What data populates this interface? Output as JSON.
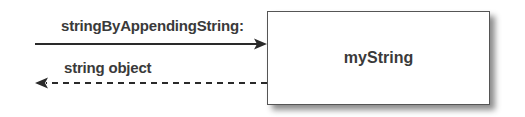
{
  "diagram": {
    "object": {
      "name": "myString"
    },
    "messages": [
      {
        "label": "stringByAppendingString:",
        "direction": "to-object",
        "style": "solid"
      },
      {
        "label": "string object",
        "direction": "from-object",
        "style": "dashed"
      }
    ]
  },
  "colors": {
    "line": "#2a2a2a",
    "text": "#3a3a3a",
    "box_border": "#555555"
  }
}
